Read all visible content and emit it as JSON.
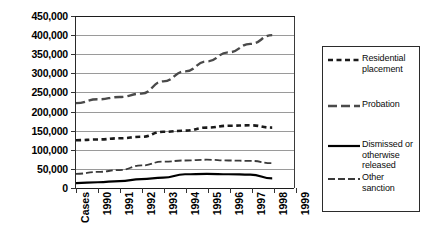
{
  "chart_data": {
    "type": "line",
    "title": "",
    "xlabel": "",
    "ylabel": "",
    "grid": true,
    "legend_position": "right",
    "x": [
      "Cases",
      "1990",
      "1991",
      "1992",
      "1993",
      "1994",
      "1995",
      "1996",
      "1997",
      "1998",
      "1999"
    ],
    "ylim": [
      0,
      450000
    ],
    "ytick_values": [
      0,
      50000,
      100000,
      150000,
      200000,
      250000,
      300000,
      350000,
      400000,
      450000
    ],
    "ytick_labels": [
      "0",
      "50,000",
      "100,000",
      "150,000",
      "200,000",
      "250,000",
      "300,000",
      "350,000",
      "400,000",
      "450,000"
    ],
    "series": [
      {
        "name": "Residential placement",
        "style": "dotted-dash",
        "color": "#1a1a1a",
        "values": [
          125000,
          127000,
          130000,
          134000,
          147000,
          150000,
          158000,
          163000,
          164000,
          158000,
          null
        ]
      },
      {
        "name": "Probation",
        "style": "long-dash",
        "color": "#4a4a4a",
        "values": [
          222000,
          232000,
          238000,
          247000,
          279000,
          305000,
          331000,
          355000,
          377000,
          400000,
          null
        ]
      },
      {
        "name": "Dismissed or otherwise released",
        "style": "solid",
        "color": "#000000",
        "values": [
          13000,
          15000,
          18000,
          23000,
          27000,
          36000,
          37000,
          36000,
          35000,
          25000,
          null
        ]
      },
      {
        "name": "Other sanction",
        "style": "dash",
        "color": "#3a3a3a",
        "values": [
          37000,
          42000,
          47000,
          59000,
          69000,
          72000,
          74000,
          72000,
          71000,
          65000,
          null
        ]
      }
    ]
  },
  "legend": {
    "items": [
      {
        "label": "Residential placement",
        "swatch": "dotted-dash-swatch"
      },
      {
        "label": "Probation",
        "swatch": "long-dash-swatch"
      },
      {
        "label": "Dismissed or otherwise released",
        "swatch": "solid-swatch"
      },
      {
        "label": "Other sanction",
        "swatch": "dash-swatch"
      }
    ]
  }
}
